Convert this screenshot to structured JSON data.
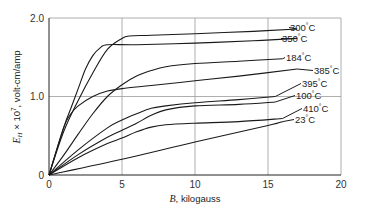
{
  "chart_data": {
    "type": "line",
    "title": "",
    "xlabel": "B, kilogauss",
    "ylabel": "E_H × 10^7, volt-cm/amp",
    "xlim": [
      0,
      20
    ],
    "ylim": [
      0,
      2.0
    ],
    "xticks": [
      "0",
      "5",
      "10",
      "15",
      "20"
    ],
    "yticks": [
      "0",
      "1.0",
      "2.0"
    ],
    "xtick_values": [
      0,
      5,
      10,
      15,
      20
    ],
    "ytick_values": [
      0,
      1.0,
      2.0
    ],
    "grid": true,
    "series": [
      {
        "name": "300°C",
        "x": [
          0,
          1,
          2,
          3,
          4,
          5,
          5.5,
          7,
          10,
          14,
          17
        ],
        "y": [
          0,
          0.55,
          0.95,
          1.3,
          1.6,
          1.74,
          1.77,
          1.78,
          1.8,
          1.83,
          1.86
        ]
      },
      {
        "name": "350°C",
        "x": [
          0,
          1,
          1.5,
          2,
          2.5,
          3,
          3.5,
          4,
          6,
          10,
          14,
          17
        ],
        "y": [
          0,
          0.6,
          0.85,
          1.1,
          1.35,
          1.52,
          1.62,
          1.66,
          1.66,
          1.68,
          1.71,
          1.74
        ]
      },
      {
        "name": "184°C",
        "x": [
          0,
          1,
          2,
          3,
          4,
          5,
          6,
          7,
          8,
          10,
          13,
          16
        ],
        "y": [
          0,
          0.25,
          0.52,
          0.78,
          1.0,
          1.15,
          1.26,
          1.33,
          1.38,
          1.42,
          1.45,
          1.48
        ]
      },
      {
        "name": "385°C",
        "x": [
          0,
          1,
          1.5,
          2,
          3,
          4,
          5,
          7,
          10,
          13,
          17
        ],
        "y": [
          0,
          0.6,
          0.78,
          0.88,
          1.0,
          1.07,
          1.1,
          1.14,
          1.2,
          1.26,
          1.35
        ]
      },
      {
        "name": "395°C",
        "x": [
          0,
          2,
          4,
          5,
          6,
          7,
          8,
          10,
          13,
          15.5
        ],
        "y": [
          0,
          0.32,
          0.6,
          0.7,
          0.78,
          0.85,
          0.88,
          0.92,
          0.96,
          1.0
        ]
      },
      {
        "name": "100°C",
        "x": [
          0,
          2,
          4,
          5,
          6,
          7,
          8,
          10,
          13,
          15.5
        ],
        "y": [
          0,
          0.26,
          0.48,
          0.57,
          0.66,
          0.76,
          0.83,
          0.88,
          0.9,
          0.93
        ]
      },
      {
        "name": "410°C",
        "x": [
          0,
          2,
          4,
          5,
          6,
          7,
          8,
          10,
          13,
          16
        ],
        "y": [
          0,
          0.22,
          0.4,
          0.47,
          0.55,
          0.61,
          0.64,
          0.66,
          0.68,
          0.72
        ]
      },
      {
        "name": "23°C",
        "x": [
          0,
          5,
          10,
          15,
          16
        ],
        "y": [
          0,
          0.2,
          0.42,
          0.63,
          0.68
        ]
      }
    ],
    "annotations": [
      {
        "text": "300°C",
        "series": "300°C"
      },
      {
        "text": "350°C",
        "series": "350°C"
      },
      {
        "text": "184°C",
        "series": "184°C"
      },
      {
        "text": "385°C",
        "series": "385°C"
      },
      {
        "text": "395°C",
        "series": "395°C"
      },
      {
        "text": "100°C",
        "series": "100°C"
      },
      {
        "text": "410°C",
        "series": "410°C"
      },
      {
        "text": "23°C",
        "series": "23°C"
      }
    ]
  }
}
